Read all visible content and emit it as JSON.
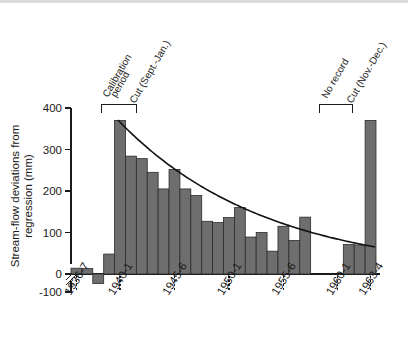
{
  "chart_data": {
    "type": "bar",
    "title": "",
    "subtitle": "",
    "xlabel": "",
    "ylabel": "Stream-flow deviations from regression (mm)",
    "ylabel_line1": "Stream-flow deviations from",
    "ylabel_line2": "regression (mm)",
    "ylim": [
      -100,
      400
    ],
    "yticks": [
      -100,
      0,
      100,
      200,
      300,
      400
    ],
    "ytick_labels": [
      "-100",
      "0",
      "100",
      "200",
      "300",
      "400"
    ],
    "y_axis_break": true,
    "grid": false,
    "legend": "none",
    "bar_color": "#6e6e6e",
    "bar_edge_color": "#2b2b2b",
    "curve_color": "#111111",
    "categories": [
      "1936-7",
      "1937-8",
      "1938-9",
      "1939-40",
      "1940-1",
      "1941-2",
      "1942-3",
      "1943-4",
      "1944-5",
      "1945-6",
      "1946-7",
      "1947-8",
      "1948-9",
      "1949-50",
      "1950-1",
      "1951-2",
      "1952-3",
      "1953-4",
      "1954-5",
      "1955-6",
      "1956-7",
      "1957-8",
      "1958-9",
      "1959-60",
      "1960-1",
      "1961-2",
      "1962-3",
      "1963-4"
    ],
    "values": [
      14,
      13,
      -23,
      48,
      370,
      284,
      278,
      245,
      205,
      252,
      205,
      189,
      127,
      124,
      136,
      160,
      89,
      100,
      55,
      115,
      81,
      137,
      null,
      null,
      null,
      71,
      70,
      370
    ],
    "missing_note": "No record",
    "xtick_labels": [
      "1936-7",
      "1940-1",
      "1945-6",
      "1950-1",
      "1955-6",
      "1960-1",
      "1963-4"
    ],
    "xtick_categories": [
      "1936-7",
      "1940-1",
      "1945-6",
      "1950-1",
      "1955-6",
      "1960-1",
      "1963-4"
    ],
    "fit_curve": {
      "description": "exponential recession fitted to post-cut deviations",
      "x_start_category": "1940-1",
      "x_end_category": "1963-4",
      "y_start": 370,
      "y_end": 65
    },
    "annotations": [
      {
        "id": "calibration-period",
        "label_line1": "Calibration",
        "label_line2": "period",
        "label": "Calibration period",
        "bracket": true
      },
      {
        "id": "cut-sept-jan",
        "label": "Cut (Sept.-Jan.)",
        "bracket": false
      },
      {
        "id": "no-record",
        "label": "No record",
        "bracket": true
      },
      {
        "id": "cut-nov-dec",
        "label": "Cut (Nov.-Dec.)",
        "bracket": false
      }
    ]
  }
}
